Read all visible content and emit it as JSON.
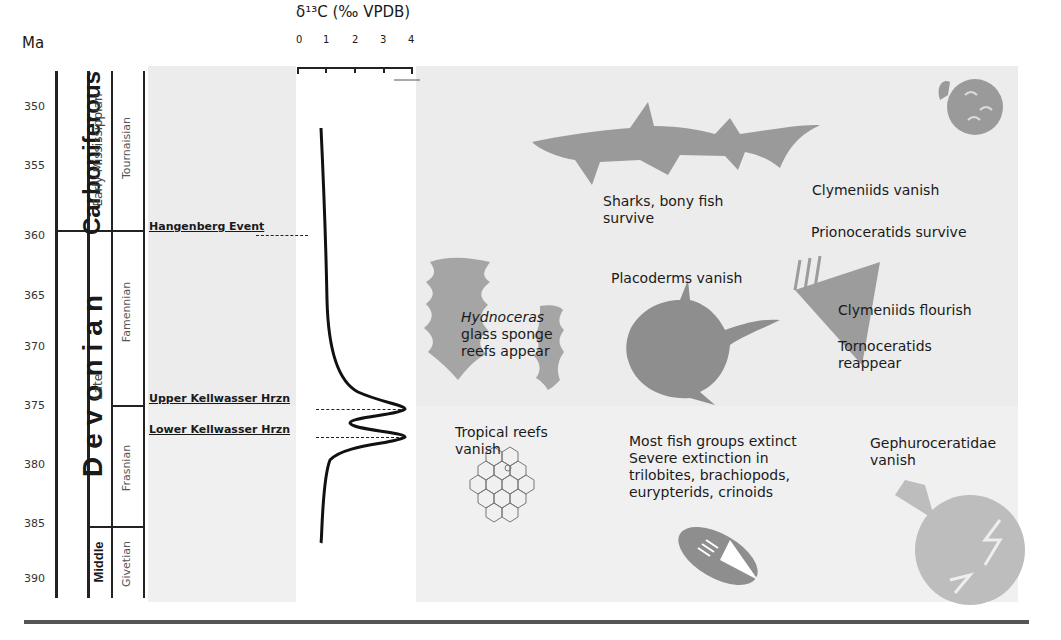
{
  "yaxis": {
    "label": "Ma",
    "ticks": [
      "350",
      "355",
      "360",
      "365",
      "370",
      "375",
      "380",
      "385",
      "390"
    ]
  },
  "periods": {
    "carboniferous": "Carboniferous",
    "devonian": "Devonian"
  },
  "epochs": {
    "early_mississippian": "Early Mississippian",
    "late": "Late",
    "middle": "Middle"
  },
  "stages": {
    "tournaisian": "Tournaisian",
    "famennian": "Famennian",
    "frasnian": "Frasnian",
    "givetian": "Givetian"
  },
  "events": {
    "hangenberg": "Hangenberg Event",
    "upper_kellwasser": "Upper Kellwasser Hrzn",
    "lower_kellwasser": "Lower Kellwasser Hrzn"
  },
  "isotope_axis": {
    "title": "δ¹³C (‰ VPDB)",
    "ticks": [
      "0",
      "1",
      "2",
      "3",
      "4"
    ]
  },
  "annotations": {
    "sharks": [
      "Sharks, bony fish",
      "survive"
    ],
    "clymeniids_vanish": "Clymeniids vanish",
    "prionoceratids": "Prionoceratids survive",
    "placoderms": "Placoderms vanish",
    "hydnoceras": [
      "Hydnoceras",
      "glass sponge",
      "reefs appear"
    ],
    "clymeniids_flourish": "Clymeniids flourish",
    "tornoceratids": [
      "Tornoceratids",
      "reappear"
    ],
    "tropical_reefs": [
      "Tropical reefs",
      "vanish"
    ],
    "fish_extinct": [
      "Most fish groups extinct",
      "Severe extinction in",
      "trilobites, brachiopods,",
      "eurypterids, crinoids"
    ],
    "gephuroceratidae": [
      "Gephuroceratidae",
      "vanish"
    ]
  },
  "icons": [
    "shark-icon",
    "ammonoid-icon",
    "glass-sponge-icon",
    "placoderm-icon",
    "goniatite-cone-icon",
    "coral-reef-icon",
    "trilobite-icon",
    "gephuroceratid-icon"
  ],
  "colors": {
    "silhouette": "#9a9a9a",
    "panel": "#ececec",
    "line": "#222222"
  }
}
